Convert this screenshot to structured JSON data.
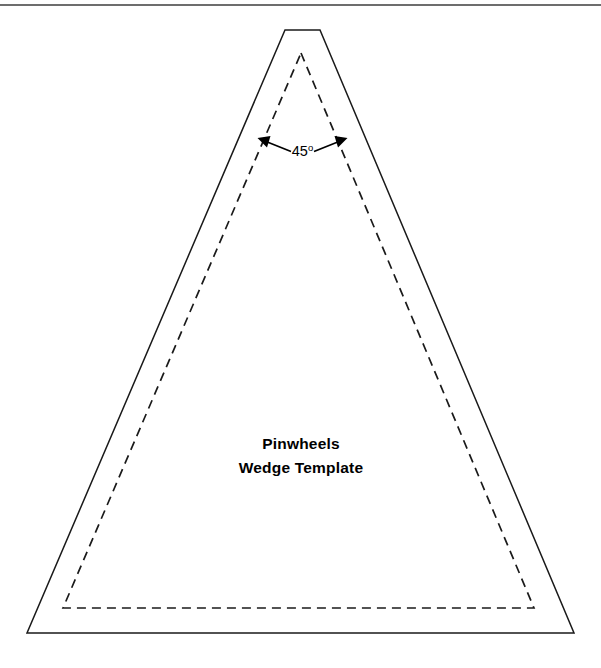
{
  "page": {
    "width": 601,
    "height": 668,
    "background_color": "#ffffff"
  },
  "divider": {
    "name": "top-horizontal-rule",
    "color": "#3c3c3c",
    "y": 5
  },
  "template": {
    "title_line1": "Pinwheels",
    "title_line2": "Wedge Template",
    "title_color": "#000000",
    "cut_line": {
      "label": "cutting-line",
      "style": "solid",
      "color": "#1a1a1a",
      "points": "285,30 320,30 574,633 27,633"
    },
    "seam_line": {
      "label": "seam-allowance-line",
      "style": "dashed",
      "color": "#1a1a1a",
      "points": "301,53 534,608 63,608"
    }
  },
  "annotation": {
    "angle_value": "45",
    "angle_unit": "o",
    "angle_full": "45o",
    "color": "#000000",
    "left_arrow": {
      "name": "angle-arrow-left",
      "from_x": 292,
      "from_y": 152,
      "to_x": 262,
      "to_y": 140
    },
    "right_arrow": {
      "name": "angle-arrow-right",
      "from_x": 313,
      "from_y": 152,
      "to_x": 343,
      "to_y": 140
    }
  }
}
